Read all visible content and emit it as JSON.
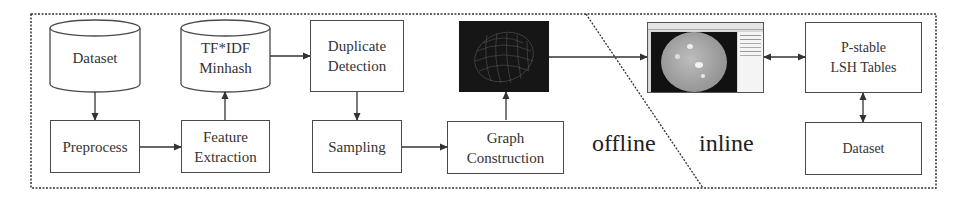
{
  "diagram": {
    "type": "pipeline-flowchart",
    "sections": {
      "offline_label": "offline",
      "inline_label": "inline"
    },
    "nodes": {
      "dataset_source": "Dataset",
      "preprocess": "Preprocess",
      "tfidf_minhash_line1": "TF*IDF",
      "tfidf_minhash_line2": "Minhash",
      "feature_extraction_line1": "Feature",
      "feature_extraction_line2": "Extraction",
      "duplicate_detection_line1": "Duplicate",
      "duplicate_detection_line2": "Detection",
      "sampling": "Sampling",
      "graph_construction_line1": "Graph",
      "graph_construction_line2": "Construction",
      "pstable_line1": "P-stable",
      "pstable_line2": "LSH Tables",
      "dataset_inline": "Dataset"
    },
    "images": {
      "graph_visualization": "graph-image",
      "application_screenshot": "app-screenshot-image"
    },
    "edges": [
      {
        "from": "Dataset",
        "to": "Preprocess",
        "direction": "one-way"
      },
      {
        "from": "Preprocess",
        "to": "Feature Extraction",
        "direction": "one-way"
      },
      {
        "from": "Feature Extraction",
        "to": "TF*IDF Minhash",
        "direction": "one-way"
      },
      {
        "from": "TF*IDF Minhash",
        "to": "Duplicate Detection",
        "direction": "one-way"
      },
      {
        "from": "Duplicate Detection",
        "to": "Sampling",
        "direction": "one-way"
      },
      {
        "from": "Sampling",
        "to": "Graph Construction",
        "direction": "one-way"
      },
      {
        "from": "Graph Construction",
        "to": "graph-image",
        "direction": "one-way"
      },
      {
        "from": "graph-image",
        "to": "app-screenshot-image",
        "direction": "one-way"
      },
      {
        "from": "app-screenshot-image",
        "to": "P-stable LSH Tables",
        "direction": "two-way"
      },
      {
        "from": "P-stable LSH Tables",
        "to": "Dataset (inline)",
        "direction": "two-way"
      }
    ],
    "colors": {
      "stroke": "#4a4a4a",
      "text": "#333333",
      "graph_bg": "#161616",
      "background": "#ffffff"
    }
  }
}
